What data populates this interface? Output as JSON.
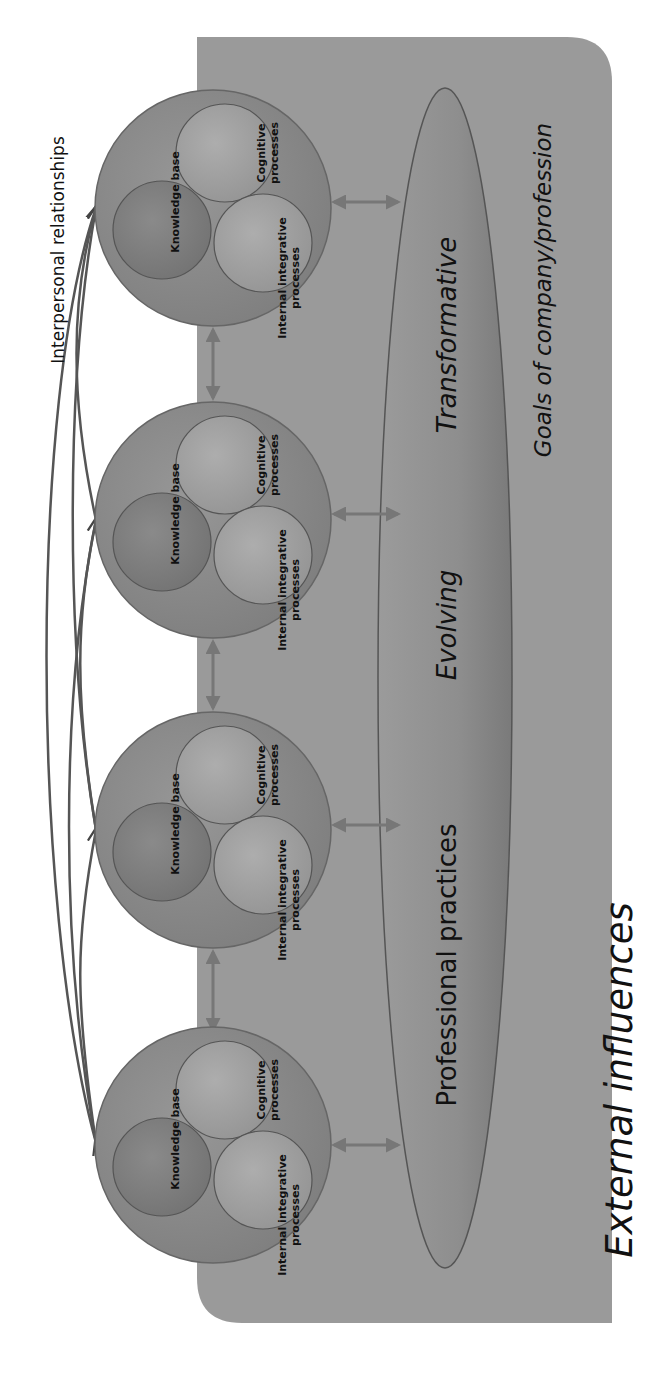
{
  "diagram": {
    "orientation": "rotated -90deg (reads bottom-to-top)",
    "interpersonal_label": "Interpersonal relationships",
    "individuals": [
      {
        "id": 1,
        "knowledge_base": "Knowledge base",
        "cognitive_line1": "Cognitive",
        "cognitive_line2": "processes",
        "integrative_line1": "Internal integrative",
        "integrative_line2": "processes"
      },
      {
        "id": 2,
        "knowledge_base": "Knowledge base",
        "cognitive_line1": "Cognitive",
        "cognitive_line2": "processes",
        "integrative_line1": "Internal integrative",
        "integrative_line2": "processes"
      },
      {
        "id": 3,
        "knowledge_base": "Knowledge base",
        "cognitive_line1": "Cognitive",
        "cognitive_line2": "processes",
        "integrative_line1": "Internal integrative",
        "integrative_line2": "processes"
      },
      {
        "id": 4,
        "knowledge_base": "Knowledge base",
        "cognitive_line1": "Cognitive",
        "cognitive_line2": "processes",
        "integrative_line1": "Internal integrative",
        "integrative_line2": "processes"
      }
    ],
    "practices": {
      "professional": "Professional practices",
      "evolving": "Evolving",
      "transformative": "Transformative"
    },
    "goals_label": "Goals of company/profession",
    "external_label": "External influences"
  },
  "colors": {
    "background": "#ffffff",
    "context_box": "#9a9a9a",
    "outer_circle": "#8c8c8c",
    "knowledge_circle": "#7e7e7e",
    "cognitive_circle": "#a2a2a2",
    "integrative_circle": "#a6a6a6",
    "ellipse_fill": "#8a8a8a",
    "stroke": "#555555",
    "arrow": "#777777",
    "text": "#111111"
  }
}
